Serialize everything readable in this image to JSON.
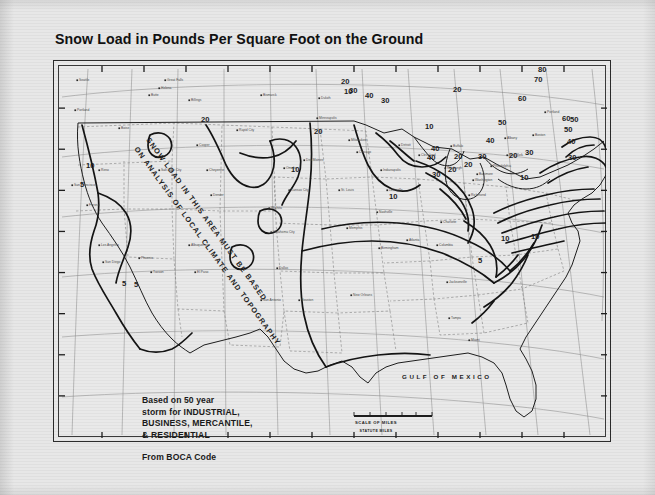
{
  "document": {
    "title": "Snow Load in Pounds Per Square Foot on the Ground"
  },
  "map": {
    "overlay_caption": "SNOW LOAD IN THIS AREA MUST BE BASED ON ANALYSIS OF LOCAL CLIMATE AND TOPOGRAPHY",
    "water_labels": [
      {
        "text": "GULF OF MEXICO",
        "x": 348,
        "y": 378
      }
    ],
    "scale_bar": {
      "title": "SCALE OF MILES",
      "unit_note": "STATUTE MILES",
      "ticks": [
        "0",
        "100",
        "200",
        "300",
        "400",
        "500"
      ]
    },
    "legend": {
      "line1": "Based on 50 year",
      "line2": "storm for INDUSTRIAL,",
      "line3": "BUSINESS, MERCANTILE,",
      "line4": "& RESIDENTIAL",
      "source": "From BOCA Code"
    },
    "contour_unit": "pounds per square foot",
    "contour_levels": [
      5,
      10,
      20,
      30,
      40,
      50,
      60,
      70,
      80
    ],
    "contour_labels": [
      {
        "value": "10",
        "x": 85,
        "y": 167
      },
      {
        "value": "5",
        "x": 79,
        "y": 186
      },
      {
        "value": "5",
        "x": 121,
        "y": 285
      },
      {
        "value": "5",
        "x": 133,
        "y": 286
      },
      {
        "value": "20",
        "x": 200,
        "y": 121
      },
      {
        "value": "20",
        "x": 313,
        "y": 133
      },
      {
        "value": "10",
        "x": 343,
        "y": 93
      },
      {
        "value": "10",
        "x": 290,
        "y": 171
      },
      {
        "value": "20",
        "x": 340,
        "y": 83
      },
      {
        "value": "30",
        "x": 348,
        "y": 92
      },
      {
        "value": "40",
        "x": 364,
        "y": 97
      },
      {
        "value": "30",
        "x": 380,
        "y": 102
      },
      {
        "value": "10",
        "x": 388,
        "y": 198
      },
      {
        "value": "10",
        "x": 424,
        "y": 128
      },
      {
        "value": "40",
        "x": 426,
        "y": 159
      },
      {
        "value": "40",
        "x": 430,
        "y": 150
      },
      {
        "value": "30",
        "x": 431,
        "y": 176
      },
      {
        "value": "20",
        "x": 447,
        "y": 171
      },
      {
        "value": "20",
        "x": 452,
        "y": 91
      },
      {
        "value": "60",
        "x": 517,
        "y": 100
      },
      {
        "value": "50",
        "x": 497,
        "y": 124
      },
      {
        "value": "40",
        "x": 485,
        "y": 142
      },
      {
        "value": "30",
        "x": 477,
        "y": 158
      },
      {
        "value": "20",
        "x": 463,
        "y": 166
      },
      {
        "value": "20",
        "x": 453,
        "y": 158
      },
      {
        "value": "80",
        "x": 537,
        "y": 71
      },
      {
        "value": "70",
        "x": 533,
        "y": 81
      },
      {
        "value": "60",
        "x": 561,
        "y": 120
      },
      {
        "value": "50",
        "x": 563,
        "y": 131
      },
      {
        "value": "40",
        "x": 566,
        "y": 143
      },
      {
        "value": "30",
        "x": 567,
        "y": 159
      },
      {
        "value": "50",
        "x": 569,
        "y": 121
      },
      {
        "value": "20",
        "x": 508,
        "y": 157
      },
      {
        "value": "30",
        "x": 524,
        "y": 154
      },
      {
        "value": "10",
        "x": 519,
        "y": 179
      },
      {
        "value": "10",
        "x": 500,
        "y": 240
      },
      {
        "value": "5",
        "x": 477,
        "y": 262
      },
      {
        "value": "10",
        "x": 530,
        "y": 238
      }
    ],
    "place_labels": [
      {
        "text": "Seattle",
        "x": 78,
        "y": 80
      },
      {
        "text": "Portland",
        "x": 76,
        "y": 110
      },
      {
        "text": "Boise",
        "x": 120,
        "y": 128
      },
      {
        "text": "Helena",
        "x": 160,
        "y": 88
      },
      {
        "text": "Great Falls",
        "x": 166,
        "y": 80
      },
      {
        "text": "Billings",
        "x": 190,
        "y": 100
      },
      {
        "text": "Butte",
        "x": 150,
        "y": 95
      },
      {
        "text": "Salt Lake City",
        "x": 160,
        "y": 170
      },
      {
        "text": "Reno",
        "x": 100,
        "y": 170
      },
      {
        "text": "San Francisco",
        "x": 73,
        "y": 185
      },
      {
        "text": "Fresno",
        "x": 88,
        "y": 205
      },
      {
        "text": "Los Angeles",
        "x": 100,
        "y": 245
      },
      {
        "text": "San Diego",
        "x": 104,
        "y": 262
      },
      {
        "text": "Phoenix",
        "x": 140,
        "y": 258
      },
      {
        "text": "Tucson",
        "x": 152,
        "y": 272
      },
      {
        "text": "Albuquerque",
        "x": 190,
        "y": 245
      },
      {
        "text": "Denver",
        "x": 212,
        "y": 195
      },
      {
        "text": "Cheyenne",
        "x": 208,
        "y": 170
      },
      {
        "text": "Casper",
        "x": 198,
        "y": 145
      },
      {
        "text": "Bismarck",
        "x": 262,
        "y": 95
      },
      {
        "text": "Rapid City",
        "x": 238,
        "y": 130
      },
      {
        "text": "Omaha",
        "x": 285,
        "y": 168
      },
      {
        "text": "Des Moines",
        "x": 305,
        "y": 160
      },
      {
        "text": "Kansas City",
        "x": 290,
        "y": 190
      },
      {
        "text": "Wichita",
        "x": 270,
        "y": 208
      },
      {
        "text": "Oklahoma City",
        "x": 272,
        "y": 232
      },
      {
        "text": "Dallas",
        "x": 278,
        "y": 268
      },
      {
        "text": "Houston",
        "x": 300,
        "y": 300
      },
      {
        "text": "San Antonio",
        "x": 262,
        "y": 300
      },
      {
        "text": "El Paso",
        "x": 196,
        "y": 272
      },
      {
        "text": "Minneapolis",
        "x": 318,
        "y": 118
      },
      {
        "text": "Duluth",
        "x": 320,
        "y": 98
      },
      {
        "text": "Milwaukee",
        "x": 350,
        "y": 140
      },
      {
        "text": "Chicago",
        "x": 358,
        "y": 152
      },
      {
        "text": "St. Louis",
        "x": 340,
        "y": 190
      },
      {
        "text": "Memphis",
        "x": 348,
        "y": 228
      },
      {
        "text": "New Orleans",
        "x": 352,
        "y": 295
      },
      {
        "text": "Detroit",
        "x": 400,
        "y": 145
      },
      {
        "text": "Cleveland",
        "x": 420,
        "y": 155
      },
      {
        "text": "Indianapolis",
        "x": 382,
        "y": 170
      },
      {
        "text": "Louisville",
        "x": 388,
        "y": 190
      },
      {
        "text": "Nashville",
        "x": 378,
        "y": 212
      },
      {
        "text": "Atlanta",
        "x": 408,
        "y": 240
      },
      {
        "text": "Birmingham",
        "x": 380,
        "y": 248
      },
      {
        "text": "Jacksonville",
        "x": 448,
        "y": 282
      },
      {
        "text": "Miami",
        "x": 470,
        "y": 340
      },
      {
        "text": "Tampa",
        "x": 450,
        "y": 318
      },
      {
        "text": "Charlotte",
        "x": 442,
        "y": 222
      },
      {
        "text": "Columbia",
        "x": 438,
        "y": 245
      },
      {
        "text": "Richmond",
        "x": 470,
        "y": 195
      },
      {
        "text": "Washington",
        "x": 474,
        "y": 180
      },
      {
        "text": "Baltimore",
        "x": 478,
        "y": 174
      },
      {
        "text": "Philadelphia",
        "x": 492,
        "y": 166
      },
      {
        "text": "New York",
        "x": 508,
        "y": 155
      },
      {
        "text": "Boston",
        "x": 534,
        "y": 135
      },
      {
        "text": "Portland",
        "x": 546,
        "y": 112
      },
      {
        "text": "Albany",
        "x": 506,
        "y": 138
      },
      {
        "text": "Buffalo",
        "x": 452,
        "y": 146
      },
      {
        "text": "Pittsburgh",
        "x": 446,
        "y": 168
      }
    ]
  }
}
